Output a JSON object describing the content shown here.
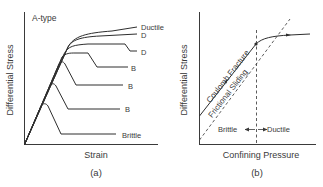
{
  "panel_a": {
    "caption": "(a)",
    "title": "A-type",
    "xlabel": "Strain",
    "ylabel": "Differential Stress",
    "curve_labels": [
      "Ductile",
      "D",
      "D",
      "B",
      "B",
      "B",
      "Brittle"
    ]
  },
  "panel_b": {
    "caption": "(b)",
    "xlabel": "Confining Pressure",
    "ylabel": "Differential Stress",
    "line_labels": {
      "coulomb": "Coulomb Fracture",
      "frictional": "Frictional Sliding"
    },
    "transition": {
      "left": "Brittle",
      "right": "Ductile"
    }
  },
  "colors": {
    "line": "#2e2e2e",
    "text": "#3a3a3a",
    "background": "#ffffff"
  }
}
